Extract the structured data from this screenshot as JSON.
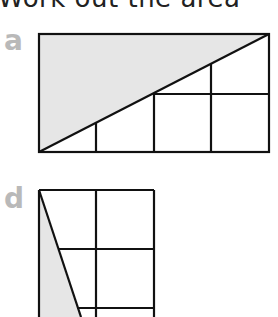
{
  "heading": "Work out the area",
  "figures": [
    {
      "label": "a",
      "shape": "rectangle with shaded triangle above diagonal",
      "grid": "4x2 with partial lines"
    },
    {
      "label": "d",
      "shape": "rectangle with shaded triangle left of diagonal",
      "grid": "2 columns, partial rows"
    }
  ],
  "colors": {
    "shade": "#e6e6e6",
    "stroke": "#111111",
    "label": "#b9b9b9"
  }
}
